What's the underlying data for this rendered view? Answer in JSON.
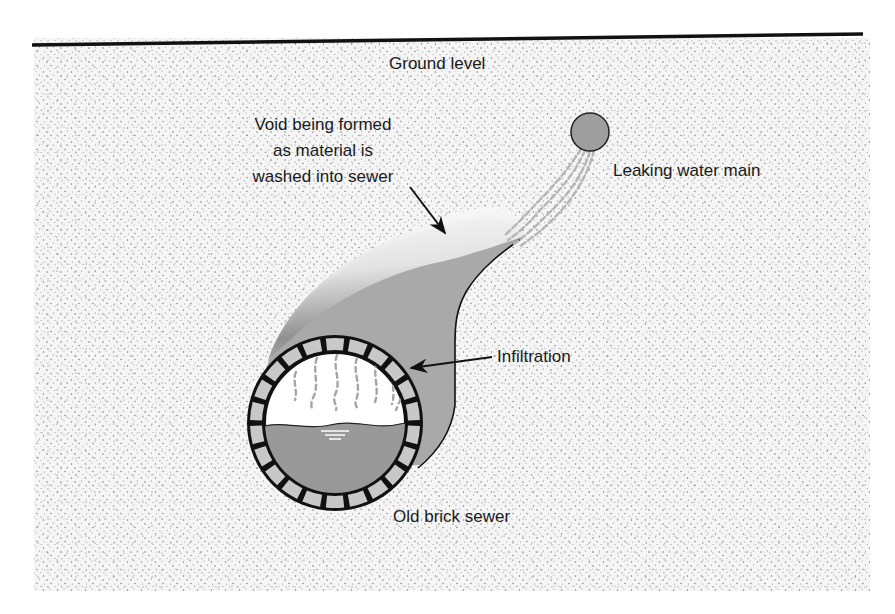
{
  "diagram": {
    "labels": {
      "ground_level": "Ground level",
      "void_line1": "Void being formed",
      "void_line2": "as material is",
      "void_line3": "washed into sewer",
      "water_main": "Leaking water main",
      "infiltration": "Infiltration",
      "sewer": "Old brick sewer"
    },
    "components": [
      {
        "id": "ground-surface",
        "label": "Ground level"
      },
      {
        "id": "water-main",
        "label": "Leaking water main"
      },
      {
        "id": "void",
        "label": "Void being formed as material is washed into sewer"
      },
      {
        "id": "brick-sewer",
        "label": "Old brick sewer"
      },
      {
        "id": "infiltration",
        "label": "Infiltration"
      }
    ],
    "relations": [
      {
        "from": "water-main",
        "to": "void",
        "type": "leak-flow"
      },
      {
        "from": "void",
        "to": "brick-sewer",
        "type": "material-washed-in"
      },
      {
        "from": "infiltration",
        "to": "brick-sewer",
        "type": "points-to"
      }
    ],
    "sewer": {
      "brick_count": 22
    },
    "colors": {
      "soil_bg": "#f4f4f4",
      "soil_dot": "#8a8a8a",
      "void_fill": "#a9a9a9",
      "water_main_fill": "#9e9e9e",
      "brick_fill": "#c8c8c8",
      "sewer_water": "#999999",
      "outline": "#111111",
      "leak_stream": "#b5b5b5"
    }
  }
}
